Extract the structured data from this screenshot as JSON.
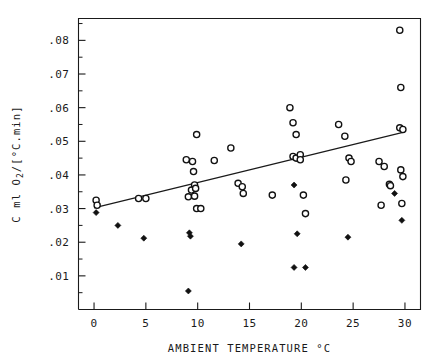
{
  "chart_data": {
    "type": "scatter",
    "title": "",
    "xlabel": "AMBIENT TEMPERATURE °C",
    "ylabel": "C ml O2/[°C.min]",
    "xlim": [
      -1.5,
      31.5
    ],
    "ylim": [
      0.0,
      0.0865
    ],
    "grid": false,
    "legend": null,
    "xticks": [
      0,
      5,
      10,
      15,
      20,
      25,
      30
    ],
    "xtick_labels": [
      "0",
      "5",
      "10",
      "15",
      "20",
      "25",
      "30"
    ],
    "yticks": [
      0.01,
      0.02,
      0.03,
      0.04,
      0.05,
      0.06,
      0.07,
      0.08
    ],
    "ytick_labels": [
      ".01",
      ".02",
      ".03",
      ".04",
      ".05",
      ".06",
      ".07",
      ".08"
    ],
    "yticks_minor": [
      0.005,
      0.015,
      0.025,
      0.035,
      0.045,
      0.055,
      0.065,
      0.075,
      0.085
    ],
    "series": [
      {
        "name": "open-circles",
        "marker": "open-circle",
        "color": "#111111",
        "points": [
          [
            0.2,
            0.0325
          ],
          [
            0.3,
            0.031
          ],
          [
            4.3,
            0.033
          ],
          [
            5.0,
            0.033
          ],
          [
            8.9,
            0.0445
          ],
          [
            9.1,
            0.0335
          ],
          [
            9.4,
            0.0355
          ],
          [
            9.5,
            0.044
          ],
          [
            9.6,
            0.041
          ],
          [
            9.7,
            0.0337
          ],
          [
            9.7,
            0.037
          ],
          [
            9.8,
            0.036
          ],
          [
            9.9,
            0.03
          ],
          [
            9.9,
            0.052
          ],
          [
            10.3,
            0.03
          ],
          [
            11.6,
            0.0443
          ],
          [
            13.2,
            0.048
          ],
          [
            13.9,
            0.0375
          ],
          [
            14.3,
            0.0365
          ],
          [
            14.4,
            0.0345
          ],
          [
            17.2,
            0.034
          ],
          [
            18.9,
            0.06
          ],
          [
            19.2,
            0.0555
          ],
          [
            19.5,
            0.052
          ],
          [
            19.2,
            0.0455
          ],
          [
            19.5,
            0.045
          ],
          [
            19.9,
            0.046
          ],
          [
            19.9,
            0.0445
          ],
          [
            20.2,
            0.034
          ],
          [
            20.4,
            0.0285
          ],
          [
            23.6,
            0.055
          ],
          [
            24.2,
            0.0515
          ],
          [
            24.6,
            0.045
          ],
          [
            24.8,
            0.044
          ],
          [
            24.3,
            0.0385
          ],
          [
            27.5,
            0.044
          ],
          [
            28.0,
            0.0425
          ],
          [
            28.5,
            0.0372
          ],
          [
            28.6,
            0.0368
          ],
          [
            27.7,
            0.031
          ],
          [
            29.5,
            0.083
          ],
          [
            29.6,
            0.066
          ],
          [
            29.5,
            0.054
          ],
          [
            29.8,
            0.0535
          ],
          [
            29.6,
            0.0415
          ],
          [
            29.8,
            0.0395
          ],
          [
            29.7,
            0.0315
          ]
        ]
      },
      {
        "name": "filled-diamonds",
        "marker": "filled-diamond",
        "color": "#111111",
        "points": [
          [
            0.2,
            0.0288
          ],
          [
            2.3,
            0.025
          ],
          [
            4.8,
            0.0212
          ],
          [
            9.2,
            0.0228
          ],
          [
            9.3,
            0.0218
          ],
          [
            9.1,
            0.0055
          ],
          [
            14.2,
            0.0195
          ],
          [
            19.3,
            0.037
          ],
          [
            19.6,
            0.0225
          ],
          [
            19.3,
            0.0125
          ],
          [
            20.4,
            0.0125
          ],
          [
            24.5,
            0.0215
          ],
          [
            29.0,
            0.0345
          ],
          [
            29.7,
            0.0265
          ]
        ]
      }
    ],
    "fit_line": {
      "name": "regression-line",
      "x0": 0.0,
      "y0": 0.0302,
      "x1": 30.0,
      "y1": 0.0528
    }
  },
  "axes": {
    "xlabel": "AMBIENT TEMPERATURE °C",
    "ylabel": "C ml O2/[°C.min]"
  }
}
